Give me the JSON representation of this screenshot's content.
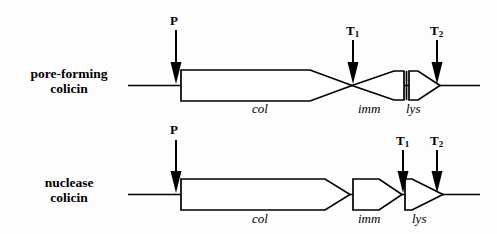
{
  "figure": {
    "type": "gene-cluster-diagram",
    "title": "",
    "background_color": "#fdfdfd",
    "stroke_color": "#000000",
    "fill_color": "#ffffff"
  },
  "rows": [
    {
      "id": "pore-forming",
      "label_line1": "pore-forming",
      "label_line2": "colicin",
      "genes": [
        {
          "name": "col",
          "orientation": "right"
        },
        {
          "name": "imm",
          "orientation": "left"
        },
        {
          "name": "lys",
          "orientation": "right"
        }
      ],
      "sites": [
        {
          "name": "P",
          "subscript": ""
        },
        {
          "name": "T",
          "subscript": "1"
        },
        {
          "name": "T",
          "subscript": "2"
        }
      ]
    },
    {
      "id": "nuclease",
      "label_line1": "nuclease",
      "label_line2": "colicin",
      "genes": [
        {
          "name": "col",
          "orientation": "right"
        },
        {
          "name": "imm",
          "orientation": "right"
        },
        {
          "name": "lys",
          "orientation": "right"
        }
      ],
      "sites": [
        {
          "name": "P",
          "subscript": ""
        },
        {
          "name": "T",
          "subscript": "1"
        },
        {
          "name": "T",
          "subscript": "2"
        }
      ]
    }
  ],
  "labels": {
    "p_top": "P",
    "t1_top": "T",
    "t1_top_sub": "1",
    "t2_top": "T",
    "t2_top_sub": "2",
    "p_bottom": "P",
    "t1_bottom": "T",
    "t1_bottom_sub": "1",
    "t2_bottom": "T",
    "t2_bottom_sub": "2",
    "col_top": "col",
    "imm_top": "imm",
    "lys_top": "lys",
    "col_bottom": "col",
    "imm_bottom": "imm",
    "lys_bottom": "lys",
    "row1_line1": "pore-forming",
    "row1_line2": "colicin",
    "row2_line1": "nuclease",
    "row2_line2": "colicin"
  }
}
